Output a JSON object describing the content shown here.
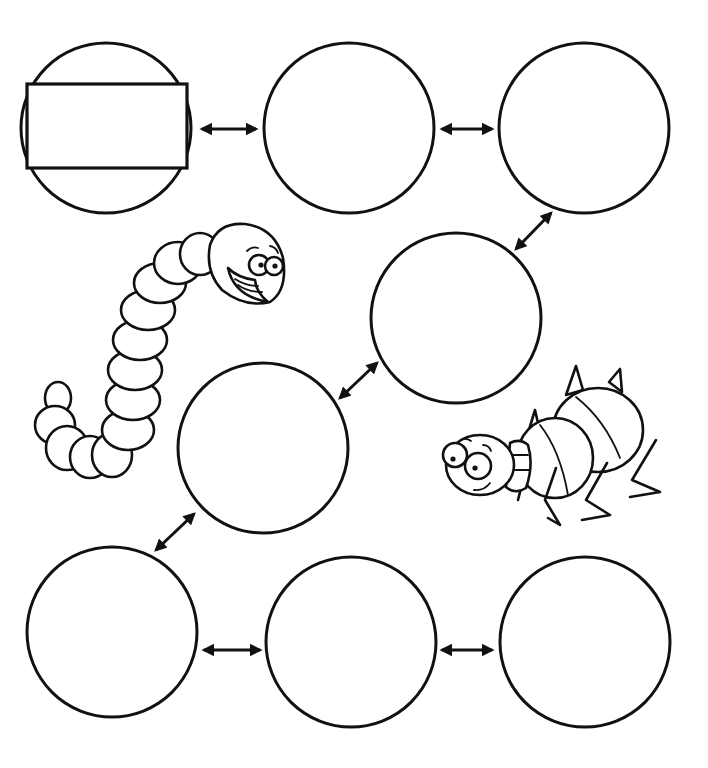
{
  "diagram": {
    "type": "cycle-chain",
    "colors": {
      "ink": "#111111",
      "paper": "#ffffff"
    },
    "nodes": [
      {
        "id": 1,
        "label": "",
        "has_label_box": true
      },
      {
        "id": 2,
        "label": ""
      },
      {
        "id": 3,
        "label": ""
      },
      {
        "id": 4,
        "label": ""
      },
      {
        "id": 5,
        "label": ""
      },
      {
        "id": 6,
        "label": ""
      },
      {
        "id": 7,
        "label": ""
      },
      {
        "id": 8,
        "label": ""
      }
    ],
    "edges": [
      {
        "from": 1,
        "to": 2,
        "style": "double-arrow"
      },
      {
        "from": 2,
        "to": 3,
        "style": "double-arrow"
      },
      {
        "from": 3,
        "to": 4,
        "style": "double-arrow"
      },
      {
        "from": 4,
        "to": 5,
        "style": "double-arrow"
      },
      {
        "from": 5,
        "to": 6,
        "style": "double-arrow"
      },
      {
        "from": 6,
        "to": 7,
        "style": "double-arrow"
      },
      {
        "from": 7,
        "to": 8,
        "style": "double-arrow"
      }
    ],
    "illustrations": [
      "worm",
      "bug"
    ]
  }
}
